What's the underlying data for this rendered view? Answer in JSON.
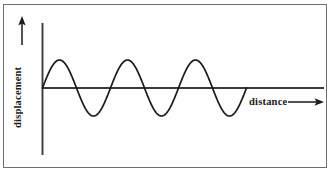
{
  "figure": {
    "name": "transverse-wave-diagram",
    "background_color": "#ffffff",
    "frame_color": "#6e6e6e",
    "ink_color": "#1a1a1a"
  },
  "axes": {
    "y_label": "displacement",
    "y_arrow_icon": "up-arrow-icon",
    "x_label": "distance",
    "x_arrow_icon": "right-arrow-icon"
  },
  "chart_data": {
    "type": "line",
    "title": "",
    "xlabel": "distance",
    "ylabel": "displacement",
    "grid": false,
    "legend": null,
    "axis_ticks": {
      "x": [],
      "y": []
    },
    "xlim": [
      0,
      4.2
    ],
    "ylim": [
      -1.35,
      1.35
    ],
    "series": [
      {
        "name": "transverse wave",
        "form": "sine",
        "amplitude": 1,
        "cycles": 3,
        "wavelength": 1,
        "phase": 0,
        "start_x": 0,
        "end_x": 3,
        "x": [
          0.0,
          0.125,
          0.25,
          0.375,
          0.5,
          0.625,
          0.75,
          0.875,
          1.0,
          1.125,
          1.25,
          1.375,
          1.5,
          1.625,
          1.75,
          1.875,
          2.0,
          2.125,
          2.25,
          2.375,
          2.5,
          2.625,
          2.75,
          2.875,
          3.0
        ],
        "y": [
          0.0,
          0.707,
          1.0,
          0.707,
          0.0,
          -0.707,
          -1.0,
          -0.707,
          0.0,
          0.707,
          1.0,
          0.707,
          0.0,
          -0.707,
          -1.0,
          -0.707,
          0.0,
          0.707,
          1.0,
          0.707,
          0.0,
          -0.707,
          -1.0,
          -0.707,
          0.0
        ]
      }
    ],
    "annotations": [
      {
        "text": "displacement",
        "position": "y-axis",
        "rotation": 90
      },
      {
        "text": "distance",
        "position": "x-axis-right",
        "rotation": 0
      }
    ]
  }
}
